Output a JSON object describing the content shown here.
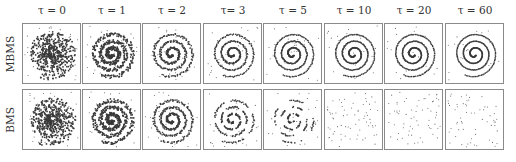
{
  "figure": {
    "columns": [
      {
        "label": "τ = 0"
      },
      {
        "label": "τ = 1"
      },
      {
        "label": "τ = 2"
      },
      {
        "label": "τ= 3"
      },
      {
        "label": "τ = 5"
      },
      {
        "label": "τ = 10"
      },
      {
        "label": "τ = 20"
      },
      {
        "label": "τ = 60"
      }
    ],
    "rows": [
      {
        "label": "MBMS",
        "description": "spiral stays coherent and sharpens as τ increases"
      },
      {
        "label": "BMS",
        "description": "spiral sharpens then breaks into dashes (τ=5) and dissolves into scattered points (τ≥10)"
      }
    ],
    "colors": {
      "points": "#3a3a3a",
      "border": "#8a8a8a",
      "background": "#ffffff"
    }
  }
}
